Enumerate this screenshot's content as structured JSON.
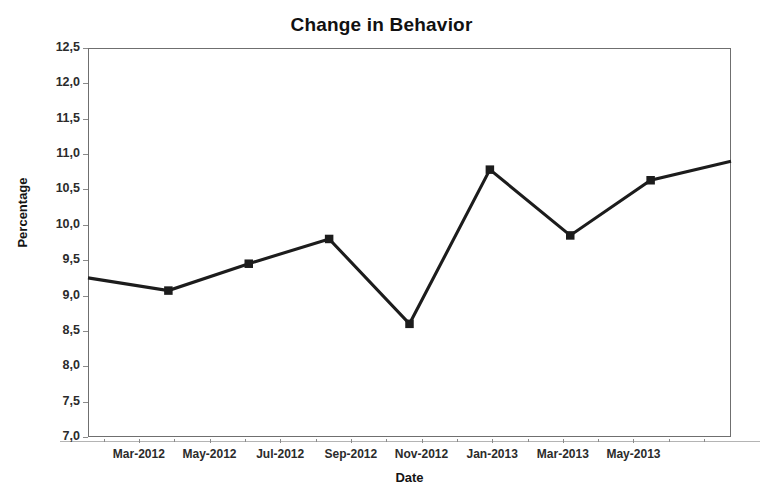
{
  "chart_data": {
    "type": "line",
    "title": "Change in Behavior",
    "xlabel": "Date",
    "ylabel": "Percentage",
    "grid": false,
    "legend": null,
    "decimal_separator": ",",
    "ylim": [
      7.0,
      12.5
    ],
    "ytick_labels": [
      "12,5",
      "12,0",
      "11,5",
      "11,0",
      "10,5",
      "10,0",
      "9,5",
      "9,0",
      "8,5",
      "8,0",
      "7,5",
      "7,0"
    ],
    "ytick_values": [
      12.5,
      12.0,
      11.5,
      11.0,
      10.5,
      10.0,
      9.5,
      9.0,
      8.5,
      8.0,
      7.5,
      7.0
    ],
    "xtick_labels": [
      "Mar-2012",
      "May-2012",
      "Jul-2012",
      "Sep-2012",
      "Nov-2012",
      "Jan-2013",
      "Mar-2013",
      "May-2013"
    ],
    "series": [
      {
        "name": "Percentage",
        "color": "#1c1c1c",
        "marker": "square",
        "x": [
          "Jan-2012",
          "Mar-2012",
          "May-2012",
          "Jul-2012",
          "Nov-2012",
          "Jan-2013",
          "Mar-2013",
          "May-2013",
          "Jul-2013"
        ],
        "values": [
          9.25,
          9.07,
          9.45,
          9.8,
          8.6,
          10.78,
          9.85,
          10.63,
          10.9
        ],
        "markers_shown": [
          false,
          true,
          true,
          true,
          true,
          true,
          true,
          true,
          false
        ]
      }
    ]
  },
  "figure": {
    "background_color": "#ffffff",
    "frame_color": "#6f6f6f",
    "tick_color": "#8a8a8a",
    "text_color": "#1a1a1a"
  }
}
